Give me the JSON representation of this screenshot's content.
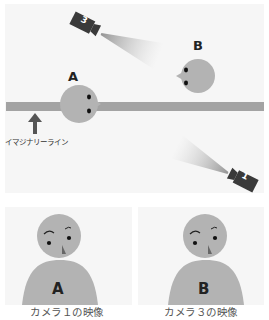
{
  "diagram": {
    "imaginary_line_label": "イマジナリーライン",
    "person_a_label": "A",
    "person_b_label": "B",
    "camera_3_label": "3",
    "camera_1_label": "1"
  },
  "views": [
    {
      "caption": "カメラ１の映像",
      "person_label": "A"
    },
    {
      "caption": "カメラ３の映像",
      "person_label": "B"
    }
  ],
  "colors": {
    "panel_bg": "#f6f6f6",
    "line": "#a3a3a3",
    "head": "#b3b3b3",
    "camera": "#3a3a3a",
    "arrow": "#555555"
  }
}
